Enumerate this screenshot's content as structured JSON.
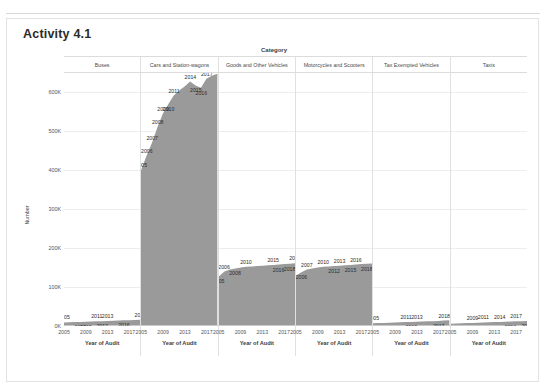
{
  "card": {
    "title": "Activity 4.1"
  },
  "chart_data": {
    "type": "area",
    "title": "Activity 4.1",
    "facet_title": "Category",
    "xlabel": "Year of Audit",
    "ylabel": "Number",
    "ylim": [
      0,
      650000
    ],
    "yticks": [
      "0K",
      "100K",
      "200K",
      "300K",
      "400K",
      "500K",
      "600K"
    ],
    "ytick_values": [
      0,
      100000,
      200000,
      300000,
      400000,
      500000,
      600000
    ],
    "xticks": [
      "2005",
      "2009",
      "2013",
      "2017"
    ],
    "xtick_values": [
      2005,
      2009,
      2013,
      2017
    ],
    "x": [
      2005,
      2006,
      2007,
      2008,
      2009,
      2010,
      2011,
      2012,
      2013,
      2014,
      2015,
      2016,
      2017,
      2018,
      2019
    ],
    "grid": true,
    "legend": "none",
    "fill_color": "#9a9a9a",
    "panels": [
      {
        "category": "Buses",
        "values": [
          9000,
          9500,
          10000,
          10500,
          11000,
          11500,
          12000,
          12500,
          13000,
          13500,
          14000,
          14500,
          15000,
          15500,
          16000
        ],
        "labels": [
          {
            "year": "2005",
            "x": 2005,
            "y": 9000,
            "place": "above"
          },
          {
            "year": "2008",
            "x": 2008,
            "y": 10500,
            "place": "below"
          },
          {
            "year": "2009",
            "x": 2009,
            "y": 11000,
            "place": "below"
          },
          {
            "year": "2011",
            "x": 2011,
            "y": 12000,
            "place": "above"
          },
          {
            "year": "2012",
            "x": 2012,
            "y": 12500,
            "place": "below"
          },
          {
            "year": "2013",
            "x": 2013,
            "y": 13000,
            "place": "above"
          },
          {
            "year": "2016",
            "x": 2016,
            "y": 14500,
            "place": "below"
          },
          {
            "year": "2019",
            "x": 2019,
            "y": 16000,
            "place": "above"
          }
        ]
      },
      {
        "category": "Cars and Station-wagons",
        "values": [
          400000,
          437000,
          470000,
          510000,
          545000,
          570000,
          592000,
          605000,
          615000,
          628000,
          618000,
          612000,
          635000,
          643000,
          648000
        ],
        "labels": [
          {
            "year": "2005",
            "x": 2005,
            "y": 400000,
            "place": "above"
          },
          {
            "year": "2006",
            "x": 2006,
            "y": 437000,
            "place": "above"
          },
          {
            "year": "2007",
            "x": 2007,
            "y": 470000,
            "place": "above"
          },
          {
            "year": "2008",
            "x": 2008,
            "y": 510000,
            "place": "above"
          },
          {
            "year": "2009",
            "x": 2009,
            "y": 545000,
            "place": "above"
          },
          {
            "year": "2010",
            "x": 2010,
            "y": 570000,
            "place": "below"
          },
          {
            "year": "2011",
            "x": 2011,
            "y": 592000,
            "place": "above"
          },
          {
            "year": "2014",
            "x": 2014,
            "y": 628000,
            "place": "above"
          },
          {
            "year": "2015",
            "x": 2015,
            "y": 618000,
            "place": "below"
          },
          {
            "year": "2016",
            "x": 2016,
            "y": 612000,
            "place": "below"
          },
          {
            "year": "2017",
            "x": 2017,
            "y": 635000,
            "place": "above"
          }
        ]
      },
      {
        "category": "Goods and Other Vehicles",
        "values": [
          128000,
          140000,
          145000,
          148000,
          150000,
          152000,
          153000,
          154000,
          155000,
          156000,
          157000,
          158000,
          159000,
          160000,
          161000
        ],
        "labels": [
          {
            "year": "2005",
            "x": 2005,
            "y": 128000,
            "place": "below"
          },
          {
            "year": "2006",
            "x": 2006,
            "y": 140000,
            "place": "above"
          },
          {
            "year": "2008",
            "x": 2008,
            "y": 148000,
            "place": "below"
          },
          {
            "year": "2010",
            "x": 2010,
            "y": 152000,
            "place": "above"
          },
          {
            "year": "2015",
            "x": 2015,
            "y": 157000,
            "place": "above"
          },
          {
            "year": "2016",
            "x": 2016,
            "y": 158000,
            "place": "below"
          },
          {
            "year": "2018",
            "x": 2018,
            "y": 160000,
            "place": "below"
          },
          {
            "year": "2019",
            "x": 2019,
            "y": 161000,
            "place": "above"
          }
        ]
      },
      {
        "category": "Motorcycles and Scooters",
        "values": [
          130000,
          138000,
          145000,
          148000,
          150000,
          152000,
          153000,
          154000,
          155000,
          156000,
          157000,
          158000,
          159000,
          160000,
          160500
        ],
        "labels": [
          {
            "year": "2006",
            "x": 2006,
            "y": 138000,
            "place": "below"
          },
          {
            "year": "2007",
            "x": 2007,
            "y": 145000,
            "place": "above"
          },
          {
            "year": "2010",
            "x": 2010,
            "y": 152000,
            "place": "above"
          },
          {
            "year": "2012",
            "x": 2012,
            "y": 154000,
            "place": "below"
          },
          {
            "year": "2013",
            "x": 2013,
            "y": 155000,
            "place": "above"
          },
          {
            "year": "2015",
            "x": 2015,
            "y": 157000,
            "place": "below"
          },
          {
            "year": "2016",
            "x": 2016,
            "y": 158000,
            "place": "above"
          },
          {
            "year": "2018",
            "x": 2018,
            "y": 160000,
            "place": "below"
          }
        ]
      },
      {
        "category": "Tax Exempted Vehicles",
        "values": [
          7000,
          7500,
          8000,
          8500,
          9000,
          9500,
          10000,
          10500,
          11000,
          11500,
          12000,
          12500,
          13000,
          14000,
          14500
        ],
        "labels": [
          {
            "year": "2005",
            "x": 2005,
            "y": 7000,
            "place": "above"
          },
          {
            "year": "2011",
            "x": 2011,
            "y": 10000,
            "place": "above"
          },
          {
            "year": "2012",
            "x": 2012,
            "y": 10500,
            "place": "below"
          },
          {
            "year": "2013",
            "x": 2013,
            "y": 11000,
            "place": "above"
          },
          {
            "year": "2017",
            "x": 2017,
            "y": 13000,
            "place": "below"
          },
          {
            "year": "2018",
            "x": 2018,
            "y": 14000,
            "place": "above"
          }
        ]
      },
      {
        "category": "Taxis",
        "values": [
          6000,
          6500,
          7000,
          7500,
          8000,
          8500,
          9000,
          9500,
          10000,
          10500,
          11000,
          11500,
          12000,
          12500,
          13000
        ],
        "labels": [
          {
            "year": "2007",
            "x": 2007,
            "y": 7000,
            "place": "below"
          },
          {
            "year": "2009",
            "x": 2009,
            "y": 8000,
            "place": "above"
          },
          {
            "year": "2010",
            "x": 2010,
            "y": 8500,
            "place": "below"
          },
          {
            "year": "2011",
            "x": 2011,
            "y": 9000,
            "place": "above"
          },
          {
            "year": "2014",
            "x": 2014,
            "y": 10500,
            "place": "above"
          },
          {
            "year": "2016",
            "x": 2016,
            "y": 11500,
            "place": "below"
          },
          {
            "year": "2017",
            "x": 2017,
            "y": 12000,
            "place": "above"
          },
          {
            "year": "2019",
            "x": 2019,
            "y": 13000,
            "place": "below"
          }
        ]
      }
    ]
  }
}
